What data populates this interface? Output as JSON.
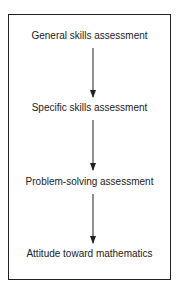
{
  "diagram": {
    "type": "flowchart",
    "direction": "top-to-bottom",
    "nodes": [
      {
        "id": "n1",
        "label": "General skills assessment"
      },
      {
        "id": "n2",
        "label": "Specific skills assessment"
      },
      {
        "id": "n3",
        "label": "Problem-solving assessment"
      },
      {
        "id": "n4",
        "label": "Attitude toward mathematics"
      }
    ],
    "edges": [
      {
        "from": "n1",
        "to": "n2"
      },
      {
        "from": "n2",
        "to": "n3"
      },
      {
        "from": "n3",
        "to": "n4"
      }
    ],
    "colors": {
      "line": "#222222",
      "text": "#222222",
      "background": "#ffffff"
    }
  }
}
